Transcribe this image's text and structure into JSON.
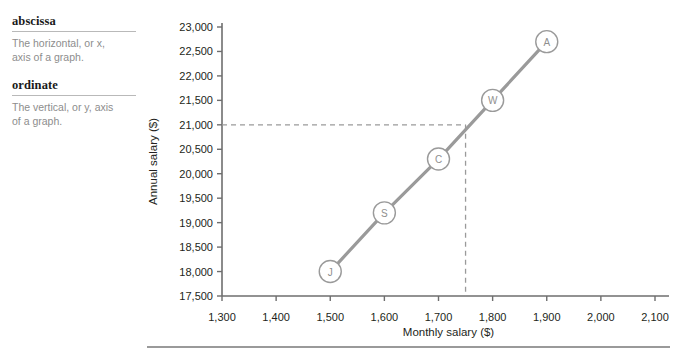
{
  "glossary": {
    "entries": [
      {
        "term": "abscissa",
        "definition_line1": "The horizontal, or x,",
        "definition_line2": "axis of a graph."
      },
      {
        "term": "ordinate",
        "definition_line1": "The vertical, or y, axis",
        "definition_line2": "of a graph."
      }
    ]
  },
  "chart_data": {
    "type": "line",
    "title": "",
    "xlabel": "Monthly salary ($)",
    "ylabel": "Annual salary ($)",
    "xlim": [
      1300,
      2100
    ],
    "ylim": [
      17500,
      23000
    ],
    "xticks": [
      1300,
      1400,
      1500,
      1600,
      1700,
      1800,
      1900,
      2000,
      2100
    ],
    "xtick_labels": [
      "1,300",
      "1,400",
      "1,500",
      "1,600",
      "1,700",
      "1,800",
      "1,900",
      "2,000",
      "2,100"
    ],
    "yticks": [
      17500,
      18000,
      18500,
      19000,
      19500,
      20000,
      20500,
      21000,
      21500,
      22000,
      22500,
      23000
    ],
    "ytick_labels": [
      "17,500",
      "18,000",
      "18,500",
      "19,000",
      "19,500",
      "20,000",
      "20,500",
      "21,000",
      "21,500",
      "22,000",
      "22,500",
      "23,000"
    ],
    "grid": false,
    "legend": "none",
    "series": [
      {
        "name": "Salary line",
        "color": "#9a9a9a",
        "x": [
          1500,
          1600,
          1700,
          1800,
          1900
        ],
        "y": [
          18000,
          19200,
          20300,
          21500,
          22700
        ],
        "point_labels": [
          "J",
          "S",
          "C",
          "W",
          "A"
        ]
      }
    ],
    "annotations": [
      {
        "name": "reference-lines",
        "type": "dashed-crosshair",
        "x": 1750,
        "y": 21000,
        "color": "#9a9a9a"
      }
    ]
  },
  "colors": {
    "line": "#9a9a9a",
    "axis": "#6e6e6e",
    "text": "#231f20",
    "muted_text": "#8d8d8d",
    "rule": "#9a9a9a"
  }
}
